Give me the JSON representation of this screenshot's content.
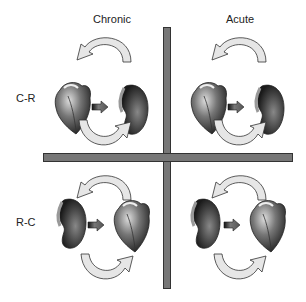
{
  "columns": [
    {
      "id": "chronic",
      "label": "Chronic"
    },
    {
      "id": "acute",
      "label": "Acute"
    }
  ],
  "rows": [
    {
      "id": "cr",
      "label": "C-R",
      "left_organ": "heart",
      "right_organ": "kidney"
    },
    {
      "id": "rc",
      "label": "R-C",
      "left_organ": "kidney",
      "right_organ": "heart"
    }
  ],
  "colors": {
    "divider": "#777777",
    "divider_border": "#333333",
    "arrow_fill": "#e6e6e6",
    "arrow_stroke": "#333333",
    "solid_arrow": "#555555",
    "heart": "#555555",
    "kidney": "#4a4a4a"
  }
}
